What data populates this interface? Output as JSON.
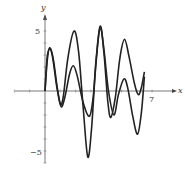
{
  "chart_data": {
    "type": "line",
    "title": "",
    "xlabel": "x",
    "ylabel": "y",
    "xlim": [
      -2,
      7.7
    ],
    "ylim": [
      -6,
      6.5
    ],
    "x_ticks": [
      {
        "value": 7,
        "label": "7"
      }
    ],
    "y_ticks": [
      {
        "value": 5,
        "label": "5"
      },
      {
        "value": -5,
        "label": "−5"
      }
    ],
    "grid": false,
    "legend": null,
    "series": [
      {
        "name": "curve-1",
        "points": [
          [
            0,
            0
          ],
          [
            0.15,
            2.6
          ],
          [
            0.3,
            3.6
          ],
          [
            0.5,
            2.8
          ],
          [
            0.75,
            0.5
          ],
          [
            1.0,
            -1.1
          ],
          [
            1.2,
            -0.4
          ],
          [
            1.5,
            2.8
          ],
          [
            1.9,
            5.0
          ],
          [
            2.2,
            3.2
          ],
          [
            2.5,
            -1.5
          ],
          [
            2.8,
            -5.5
          ],
          [
            3.05,
            -3.0
          ],
          [
            3.3,
            1.8
          ],
          [
            3.6,
            5.3
          ],
          [
            3.85,
            3.2
          ],
          [
            4.1,
            -0.8
          ],
          [
            4.3,
            -2.2
          ],
          [
            4.6,
            -0.5
          ],
          [
            4.9,
            2.8
          ],
          [
            5.2,
            4.3
          ],
          [
            5.5,
            2.8
          ],
          [
            5.85,
            0.6
          ],
          [
            6.1,
            -0.3
          ],
          [
            6.3,
            0.3
          ],
          [
            6.5,
            1.6
          ]
        ]
      },
      {
        "name": "curve-2",
        "points": [
          [
            0,
            0
          ],
          [
            0.15,
            2.9
          ],
          [
            0.35,
            3.5
          ],
          [
            0.55,
            2.6
          ],
          [
            0.8,
            0.3
          ],
          [
            1.05,
            -1.3
          ],
          [
            1.3,
            -0.5
          ],
          [
            1.6,
            1.4
          ],
          [
            1.85,
            2.1
          ],
          [
            2.1,
            1.3
          ],
          [
            2.5,
            -1.0
          ],
          [
            2.9,
            -2.1
          ],
          [
            3.15,
            -0.5
          ],
          [
            3.35,
            2.8
          ],
          [
            3.6,
            5.4
          ],
          [
            3.85,
            3.5
          ],
          [
            4.15,
            0.0
          ],
          [
            4.5,
            -2.0
          ],
          [
            4.8,
            -0.3
          ],
          [
            5.15,
            1.0
          ],
          [
            5.4,
            0.3
          ],
          [
            5.75,
            -2.2
          ],
          [
            6.05,
            -3.6
          ],
          [
            6.3,
            -1.8
          ],
          [
            6.5,
            1.2
          ]
        ]
      }
    ]
  },
  "axes": {
    "x_label": "x",
    "y_label": "y",
    "tick_7": "7",
    "tick_5": "5",
    "tick_neg5": "−5"
  }
}
